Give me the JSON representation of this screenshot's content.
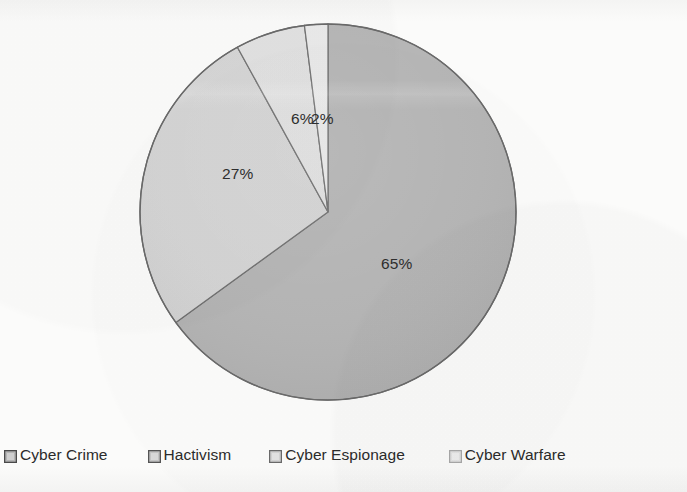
{
  "chart_data": {
    "type": "pie",
    "title": "",
    "subtitle": "",
    "xlabel": "",
    "ylabel": "",
    "grid": false,
    "legend_position": "bottom",
    "start_angle_deg": 0,
    "direction": "clockwise",
    "categories": [
      "Cyber Crime",
      "Hactivism",
      "Cyber Espionage",
      "Cyber Warfare"
    ],
    "values": [
      65,
      27,
      6,
      2
    ],
    "value_unit": "%",
    "data_labels": [
      "65%",
      "27%",
      "6%",
      "2%"
    ],
    "slice_colors": [
      "#b4b4b4",
      "#d4d4d4",
      "#e0e0e0",
      "#e9e9e9"
    ],
    "slice_border_color": "#6e6e6e",
    "slices": [
      {
        "label": "Cyber Crime",
        "value": 65,
        "data_label": "65%",
        "color": "#b4b4b4",
        "start_deg": 0,
        "end_deg": 234
      },
      {
        "label": "Hactivism",
        "value": 27,
        "data_label": "27%",
        "color": "#d4d4d4",
        "start_deg": 234,
        "end_deg": 331.2
      },
      {
        "label": "Cyber Espionage",
        "value": 6,
        "data_label": "6%",
        "color": "#e0e0e0",
        "start_deg": 331.2,
        "end_deg": 352.8
      },
      {
        "label": "Cyber Warfare",
        "value": 2,
        "data_label": "2%",
        "color": "#e9e9e9",
        "start_deg": 352.8,
        "end_deg": 360
      }
    ]
  },
  "legend": {
    "items": [
      {
        "label": "Cyber Crime",
        "color": "#b4b4b4"
      },
      {
        "label": "Hactivism",
        "color": "#d4d4d4"
      },
      {
        "label": "Cyber Espionage",
        "color": "#e0e0e0"
      },
      {
        "label": "Cyber Warfare",
        "color": "#e9e9e9"
      }
    ]
  },
  "labels": {
    "slice_65": "65%",
    "slice_27": "27%",
    "slice_6": "6%",
    "slice_2": "2%"
  },
  "colors": {
    "background": "#fbfbfa",
    "text": "#2b2b2b",
    "outline": "#6e6e6e",
    "swatch_border": "#4a4a4a"
  }
}
